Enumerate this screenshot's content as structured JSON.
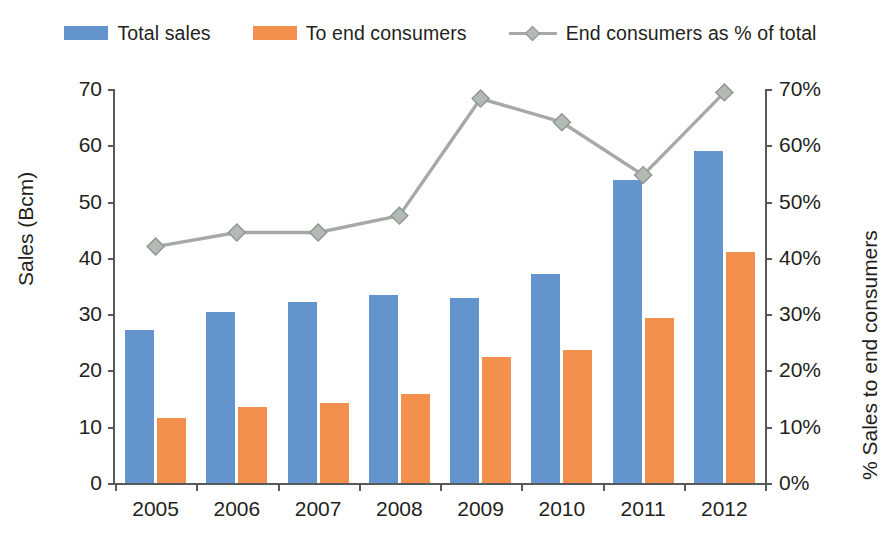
{
  "legend": {
    "items": [
      {
        "label": "Total sales",
        "marker": "square-swatch-icon",
        "color": "#6394ce"
      },
      {
        "label": "To end consumers",
        "marker": "square-swatch-icon",
        "color": "#f4904d"
      },
      {
        "label": "End consumers as % of total",
        "marker": "line-diamond-marker-icon",
        "color": "#a5aaa5"
      }
    ]
  },
  "axes": {
    "left_title": "Sales (Bcm)",
    "right_title": "% Sales to end consumers",
    "left_ticks": [
      "0",
      "10",
      "20",
      "30",
      "40",
      "50",
      "60",
      "70"
    ],
    "right_ticks": [
      "0%",
      "10%",
      "20%",
      "30%",
      "40%",
      "50%",
      "60%",
      "70%"
    ],
    "x_ticks": [
      "2005",
      "2006",
      "2007",
      "2008",
      "2009",
      "2010",
      "2011",
      "2012"
    ]
  },
  "chart_data": {
    "type": "bar",
    "title": "",
    "xlabel": "",
    "ylabel": "Sales (Bcm)",
    "y2label": "% Sales to end consumers",
    "categories": [
      "2005",
      "2006",
      "2007",
      "2008",
      "2009",
      "2010",
      "2011",
      "2012"
    ],
    "ylim": [
      0,
      70
    ],
    "y2lim": [
      0,
      70
    ],
    "grid": false,
    "legend_position": "top-center",
    "series": [
      {
        "name": "Total sales",
        "type": "bar",
        "axis": "left",
        "unit": "Bcm",
        "color": "#6394ce",
        "values": [
          27.2,
          30.3,
          32.1,
          33.4,
          32.9,
          37.1,
          53.8,
          59.0
        ]
      },
      {
        "name": "To end consumers",
        "type": "bar",
        "axis": "left",
        "unit": "Bcm",
        "color": "#f4904d",
        "values": [
          11.5,
          13.5,
          14.3,
          15.8,
          22.4,
          23.7,
          29.4,
          41.0
        ]
      },
      {
        "name": "End consumers as % of total",
        "type": "line",
        "axis": "right",
        "unit": "%",
        "color": "#a5aaa5",
        "marker": "diamond",
        "values": [
          42.0,
          44.5,
          44.5,
          47.5,
          68.3,
          64.1,
          54.7,
          69.4
        ]
      }
    ]
  }
}
